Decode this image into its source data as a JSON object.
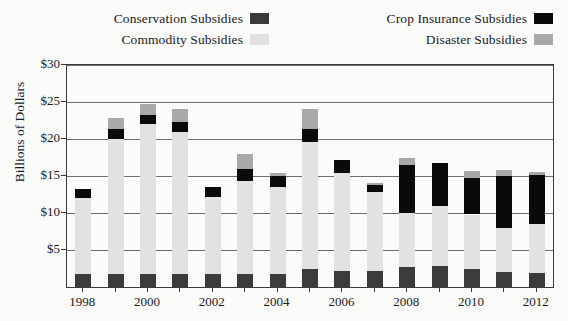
{
  "legend": {
    "items": [
      {
        "label": "Conservation Subsidies",
        "key": "conservation",
        "color": "#3b3b3b"
      },
      {
        "label": "Crop Insurance Subsidies",
        "key": "crop_insurance",
        "color": "#0a0a0a"
      },
      {
        "label": "Commodity Subsidies",
        "key": "commodity",
        "color": "#e2e2e0"
      },
      {
        "label": "Disaster Subsidies",
        "key": "disaster",
        "color": "#a8a8a6"
      }
    ]
  },
  "axes": {
    "y_title": "Billions of Dollars",
    "y_ticks": [
      "$5",
      "$10",
      "$15",
      "$20",
      "$25",
      "$30"
    ],
    "x_ticks": [
      "1998",
      "2000",
      "2002",
      "2004",
      "2006",
      "2008",
      "2010",
      "2012"
    ]
  },
  "chart_data": {
    "type": "bar",
    "title": "",
    "subtitle": "",
    "xlabel": "",
    "ylabel": "Billions of Dollars",
    "stacked": true,
    "grid": true,
    "legend_position": "top",
    "ylim": [
      0,
      30
    ],
    "ytick_values": [
      5,
      10,
      15,
      20,
      25,
      30
    ],
    "ytick_labels": [
      "$5",
      "$10",
      "$15",
      "$20",
      "$25",
      "$30"
    ],
    "categories": [
      1998,
      1999,
      2000,
      2001,
      2002,
      2003,
      2004,
      2005,
      2006,
      2007,
      2008,
      2009,
      2010,
      2011,
      2012
    ],
    "xtick_labels": [
      "1998",
      "",
      "2000",
      "",
      "2002",
      "",
      "2004",
      "",
      "2006",
      "",
      "2008",
      "",
      "2010",
      "",
      "2012"
    ],
    "series": [
      {
        "name": "Conservation Subsidies",
        "color": "#3b3b3b",
        "values": [
          1.7,
          1.7,
          1.7,
          1.7,
          1.7,
          1.7,
          1.7,
          2.4,
          2.2,
          2.2,
          2.7,
          2.9,
          2.4,
          2.0,
          1.9
        ]
      },
      {
        "name": "Commodity Subsidies",
        "color": "#e2e2e0",
        "values": [
          10.3,
          18.3,
          20.3,
          19.3,
          10.5,
          12.6,
          11.8,
          17.2,
          13.2,
          10.6,
          7.3,
          8.1,
          7.4,
          6.0,
          6.6
        ]
      },
      {
        "name": "Crop Insurance Subsidies",
        "color": "#0a0a0a",
        "values": [
          1.3,
          1.3,
          1.2,
          1.3,
          1.3,
          1.7,
          1.5,
          1.8,
          1.8,
          1.0,
          6.5,
          5.7,
          4.9,
          7.0,
          6.6
        ]
      },
      {
        "name": "Disaster Subsidies",
        "color": "#a8a8a6",
        "values": [
          0.0,
          1.5,
          1.5,
          1.7,
          0.0,
          2.0,
          0.4,
          2.7,
          0.0,
          0.2,
          0.9,
          0.0,
          1.0,
          0.8,
          0.4
        ]
      }
    ],
    "totals": [
      13.3,
      22.8,
      24.7,
      24.0,
      13.5,
      18.0,
      15.4,
      24.1,
      17.2,
      14.0,
      17.4,
      16.7,
      15.7,
      15.8,
      15.5
    ]
  }
}
